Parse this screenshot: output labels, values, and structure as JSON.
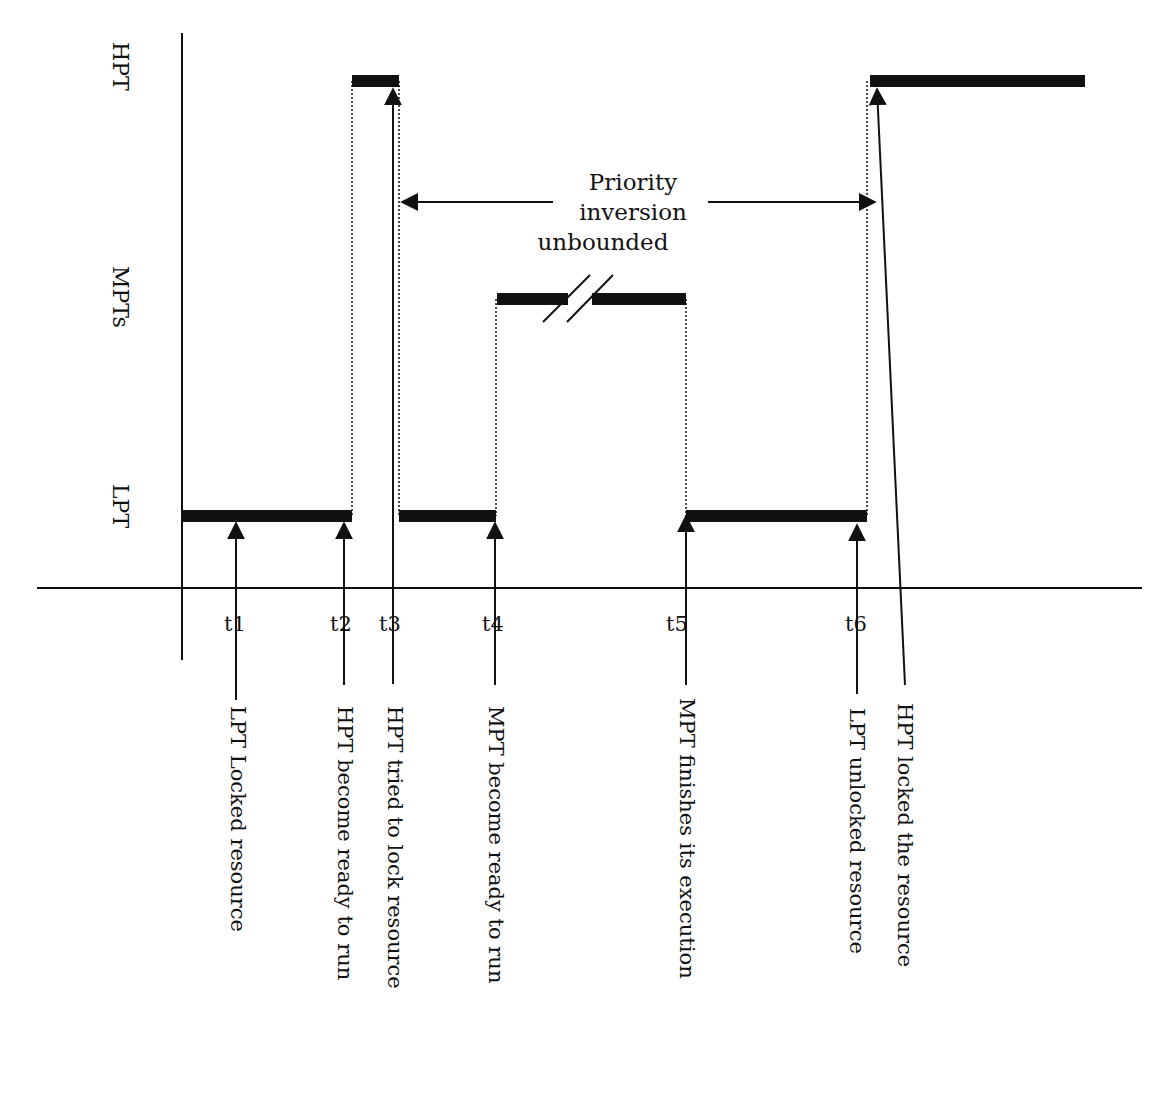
{
  "diagram": {
    "type": "timeline",
    "lanes": [
      {
        "id": "hpt",
        "label": "HPT"
      },
      {
        "id": "mpts",
        "label": "MPTs"
      },
      {
        "id": "lpt",
        "label": "LPT"
      }
    ],
    "ticks": [
      {
        "id": "t1",
        "label": "t1"
      },
      {
        "id": "t2",
        "label": "t2"
      },
      {
        "id": "t3",
        "label": "t3"
      },
      {
        "id": "t4",
        "label": "t4"
      },
      {
        "id": "t5",
        "label": "t5"
      },
      {
        "id": "t6",
        "label": "t6"
      }
    ],
    "events": [
      {
        "tick": "t1",
        "label": "LPT Locked resource"
      },
      {
        "tick": "t2",
        "label": "HPT become ready to run"
      },
      {
        "tick": "t3",
        "label": "HPT tried to lock resource"
      },
      {
        "tick": "t4",
        "label": "MPT become ready to run"
      },
      {
        "tick": "t5",
        "label": "MPT finishes its execution"
      },
      {
        "tick": "t6",
        "label": "LPT unlocked resource"
      },
      {
        "tick": "after-t6",
        "label": "HPT locked the resource"
      }
    ],
    "annotation": {
      "lines": [
        "Priority",
        "inversion",
        "unbounded"
      ],
      "spans": "t3 to HPT lock"
    },
    "execution_segments": [
      {
        "lane": "lpt",
        "from": "t0",
        "to": "t2"
      },
      {
        "lane": "hpt",
        "from": "t2",
        "to": "t3"
      },
      {
        "lane": "lpt",
        "from": "t3",
        "to": "t4"
      },
      {
        "lane": "mpts",
        "from": "t4",
        "to": "t5",
        "break": true
      },
      {
        "lane": "lpt",
        "from": "t5",
        "to": "t6"
      },
      {
        "lane": "hpt",
        "from": "after-t6",
        "to": "end"
      }
    ],
    "colors": {
      "ink": "#111111",
      "background": "#ffffff"
    }
  }
}
